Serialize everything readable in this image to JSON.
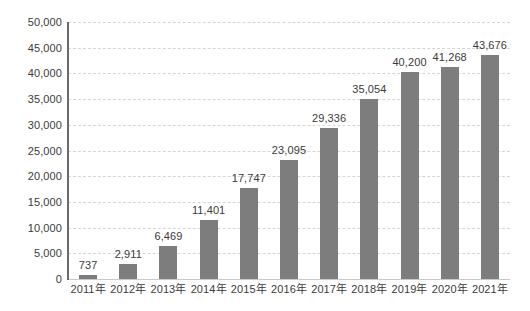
{
  "chart_data": {
    "type": "bar",
    "title": "",
    "subtitle": "",
    "xlabel": "",
    "ylabel": "",
    "categories": [
      "2011年",
      "2012年",
      "2013年",
      "2014年",
      "2015年",
      "2016年",
      "2017年",
      "2018年",
      "2019年",
      "2020年",
      "2021年"
    ],
    "values": [
      737,
      2911,
      6469,
      11401,
      17747,
      23095,
      29336,
      35054,
      40200,
      41268,
      43676
    ],
    "data_labels": [
      "737",
      "2,911",
      "6,469",
      "11,401",
      "17,747",
      "23,095",
      "29,336",
      "35,054",
      "40,200",
      "41,268",
      "43,676"
    ],
    "ylim": [
      0,
      50000
    ],
    "y_tick_step": 5000,
    "y_tick_labels": [
      "50,000",
      "45,000",
      "40,000",
      "35,000",
      "30,000",
      "25,000",
      "20,000",
      "15,000",
      "10,000",
      "5,000",
      "0"
    ],
    "y_tick_values": [
      50000,
      45000,
      40000,
      35000,
      30000,
      25000,
      20000,
      15000,
      10000,
      5000,
      0
    ],
    "grid": true,
    "grid_style": "dashed-horizontal",
    "legend": false,
    "legend_position": "none",
    "colors": {
      "bar": "#7d7d7d",
      "gridline": "#d6d6d6",
      "axis_line": "#6b6b6b",
      "baseline": "#c9c9c9",
      "text": "#3b3b3b",
      "background": "#ffffff"
    }
  }
}
